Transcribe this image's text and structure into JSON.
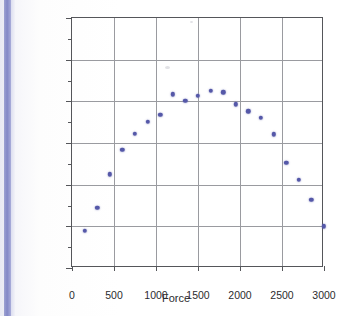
{
  "figure": {
    "background_color": "#ffffff",
    "binding_color": "#8388c6",
    "axis_color": "#55565a",
    "grid_color": "#9a9ba0",
    "marker_color": "#5558a8"
  },
  "chart_data": {
    "type": "scatter",
    "title": "",
    "xlabel": "Force",
    "ylabel": "Residuals",
    "xlim": [
      0,
      3000
    ],
    "ylim": [
      -0.006,
      0.006
    ],
    "xticks": [
      0,
      500,
      1000,
      1500,
      2000,
      2500,
      3000
    ],
    "xticklabels": [
      "0",
      "500",
      "1000",
      "1500",
      "2000",
      "2500",
      "3000"
    ],
    "yticks": [
      0.006,
      0.004,
      0.002,
      0,
      -0.002,
      -0.004,
      -0.006
    ],
    "yticklabels": [
      "0.006",
      "0.004",
      "0.002",
      "0",
      "−0.002",
      "−0.004",
      "−0.006"
    ],
    "y_minor_ticks": [
      0.005,
      0.003,
      0.001,
      -0.001,
      -0.003,
      -0.005
    ],
    "grid": true,
    "grid_axis": "both",
    "legend": false,
    "marker": "circle",
    "marker_color": "#5558a8",
    "series": [
      {
        "name": "residuals",
        "x": [
          150,
          300,
          450,
          600,
          750,
          900,
          1050,
          1200,
          1350,
          1500,
          1650,
          1800,
          1950,
          2100,
          2250,
          2400,
          2550,
          2700,
          2850,
          3000
        ],
        "y": [
          -0.0042,
          -0.0031,
          -0.0015,
          -0.00033,
          0.00043,
          0.00103,
          0.00135,
          0.00233,
          0.00203,
          0.00228,
          0.00252,
          0.00243,
          0.00185,
          0.00152,
          0.0012,
          0.00042,
          -0.00095,
          -0.00177,
          -0.00272,
          -0.004
        ]
      }
    ]
  }
}
